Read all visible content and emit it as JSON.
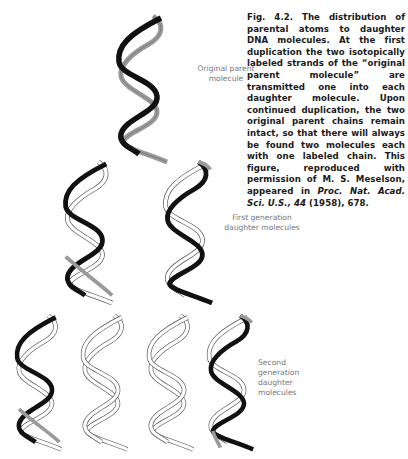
{
  "figure": {
    "number": "Fig. 4.2.",
    "caption_parts": {
      "p1": " The distribution of parental atoms to daughter DNA molecules. At the first duplication the two isotopically labeled strands of the “original parent molecule” are transmitted one into each daughter molecule. Upon continued duplication, the two original parent chains remain intact, so that there will always be found two molecules each with one labeled chain. This figure, reproduced with permission of M. S. Meselson, appeared in ",
      "journal": "Proc. Nat. Acad. Sci. U.S., 44",
      "p2": " (1958), 678."
    }
  },
  "labels": {
    "original_line1": "Original parent",
    "original_line2": "molecule",
    "first_line1": "First generation",
    "first_line2": "daughter molecules",
    "second_line1": "Second generation",
    "second_line2": "daughter molecules"
  },
  "colors": {
    "labeled_strand_dark": "#111111",
    "labeled_strand_gray": "#9a9a9a",
    "new_strand_outline": "#555555",
    "label_text": "#777777"
  },
  "molecules": {
    "original": {
      "strand_a": "black",
      "strand_b": "gray"
    },
    "first_generation": [
      {
        "strand_a": "black",
        "strand_b": "new"
      },
      {
        "strand_a": "new",
        "strand_b": "black"
      }
    ],
    "second_generation": [
      {
        "strand_a": "black",
        "strand_b": "new"
      },
      {
        "strand_a": "new",
        "strand_b": "new"
      },
      {
        "strand_a": "new",
        "strand_b": "new"
      },
      {
        "strand_a": "new",
        "strand_b": "black"
      }
    ]
  }
}
